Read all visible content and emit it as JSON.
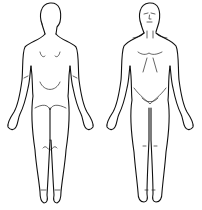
{
  "figure": {
    "views": [
      {
        "id": "back",
        "label": ""
      },
      {
        "id": "front",
        "label": ""
      }
    ],
    "colors": {
      "background": "#ffffff",
      "stroke": "#111111"
    }
  }
}
